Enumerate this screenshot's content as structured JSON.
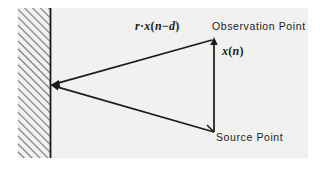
{
  "figure": {
    "background_color": "#ffffff",
    "plate_color": "#f1f1ef",
    "ink_color": "#1b1b1b"
  },
  "labels": {
    "reflected_signal": {
      "prefix": "r",
      "dot": "·",
      "func": "x",
      "open": "(",
      "arg": "n",
      "minus": "−",
      "delay": "d",
      "close": ")",
      "full_text": "r·x(n − d)"
    },
    "observation_point": "Observation Point",
    "direct_signal": {
      "func": "x",
      "open": "(",
      "arg": "n",
      "close": ")",
      "full_text": "x(n)"
    },
    "source_point": "Source Point"
  },
  "geometry": {
    "wall": {
      "name": "hatched-wall",
      "hatch_angle_deg": 45,
      "hatch_spacing_px": 5,
      "face_x": 50,
      "left_x": 18,
      "top_y": 8,
      "bottom_y": 158
    },
    "points": {
      "reflection_point": {
        "x": 51,
        "y": 85
      },
      "observation_point": {
        "x": 214,
        "y": 39
      },
      "source_point": {
        "x": 214,
        "y": 132
      }
    },
    "rays": [
      {
        "name": "source-to-wall",
        "from": "source_point",
        "to": "reflection_point",
        "arrow_at": "to"
      },
      {
        "name": "wall-to-observation",
        "from": "reflection_point",
        "to": "observation_point",
        "arrow_at": "to"
      },
      {
        "name": "source-to-observation",
        "from": "source_point",
        "to": "observation_point",
        "arrow_at": "to"
      }
    ]
  }
}
